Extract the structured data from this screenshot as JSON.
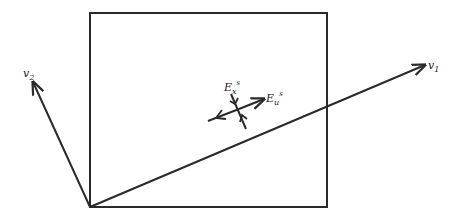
{
  "diagram": {
    "type": "phase-space schematic",
    "stroke_color": "#2a2a2a",
    "background": "#ffffff",
    "rectangle": {
      "x": 90,
      "y": 13,
      "width": 237,
      "height": 194
    },
    "origin": {
      "x": 90,
      "y": 207
    },
    "vectors": [
      {
        "id": "v1",
        "label": "v",
        "subscript": "1",
        "tip": {
          "x": 425,
          "y": 65
        }
      },
      {
        "id": "v2",
        "label": "v",
        "subscript": "2",
        "tip": {
          "x": 33,
          "y": 82
        }
      }
    ],
    "manifolds": {
      "stable": {
        "label": "E",
        "subscript": "x",
        "superscript": "s"
      },
      "unstable": {
        "label": "E",
        "subscript": "u",
        "superscript": "s"
      }
    }
  }
}
